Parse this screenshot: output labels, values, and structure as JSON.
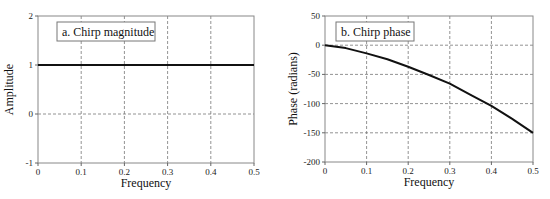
{
  "chart_data": [
    {
      "type": "line",
      "title": "a.  Chirp magnitude",
      "xlabel": "Frequency",
      "ylabel": "Amplitude",
      "xlim": [
        0,
        0.5
      ],
      "ylim": [
        -1,
        2
      ],
      "xticks": [
        "0",
        "0.1",
        "0.2",
        "0.3",
        "0.4",
        "0.5"
      ],
      "yticks": [
        "-1",
        "0",
        "1",
        "2"
      ],
      "grid": true,
      "series": [
        {
          "name": "Chirp magnitude",
          "x": [
            0,
            0.1,
            0.2,
            0.3,
            0.4,
            0.5
          ],
          "values": [
            1,
            1,
            1,
            1,
            1,
            1
          ]
        }
      ]
    },
    {
      "type": "line",
      "title": "b.  Chirp phase",
      "xlabel": "Frequency",
      "ylabel": "Phase (radians)",
      "xlim": [
        0,
        0.5
      ],
      "ylim": [
        -200,
        50
      ],
      "xticks": [
        "0",
        "0.1",
        "0.2",
        "0.3",
        "0.4",
        "0.5"
      ],
      "yticks": [
        "-200",
        "-150",
        "-100",
        "-50",
        "0",
        "50"
      ],
      "grid": true,
      "series": [
        {
          "name": "Chirp phase",
          "x": [
            0,
            0.05,
            0.1,
            0.15,
            0.2,
            0.25,
            0.3,
            0.35,
            0.4,
            0.45,
            0.5
          ],
          "values": [
            0,
            -5,
            -14,
            -24,
            -37,
            -51,
            -66,
            -85,
            -104,
            -126,
            -150
          ]
        }
      ]
    }
  ]
}
